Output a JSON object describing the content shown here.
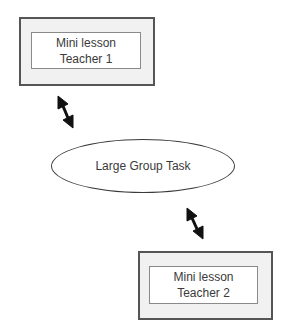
{
  "diagram": {
    "nodes": [
      {
        "id": "box1",
        "shape": "double-rectangle",
        "lines": [
          "Mini lesson",
          "Teacher 1"
        ]
      },
      {
        "id": "center",
        "shape": "ellipse",
        "label": "Large Group Task"
      },
      {
        "id": "box2",
        "shape": "double-rectangle",
        "lines": [
          "Mini lesson",
          "Teacher 2"
        ]
      }
    ],
    "edges": [
      {
        "from": "box1",
        "to": "center",
        "type": "bidirectional-arrow"
      },
      {
        "from": "center",
        "to": "box2",
        "type": "bidirectional-arrow"
      }
    ],
    "colors": {
      "outer_fill": "#f1f1f1",
      "outer_border": "#555555",
      "inner_border": "#8a8a8a",
      "arrow": "#111111",
      "text": "#3a3a3a"
    }
  }
}
